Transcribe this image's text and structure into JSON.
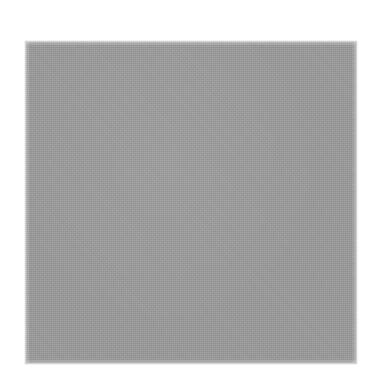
{
  "image": {
    "kind": "scanned-color-swatch",
    "background_color": "#ffffff",
    "width_px": 374,
    "height_px": 392,
    "visible_text": "",
    "labels": []
  },
  "swatch": {
    "name": "gray-square",
    "shape": "square",
    "fill_color": "#9b9b9b",
    "edge_color": "#9b9b9b",
    "texture": "fine-scan-grain",
    "left_px": 26,
    "top_px": 42,
    "width_px": 330,
    "height_px": 321,
    "caption": ""
  }
}
